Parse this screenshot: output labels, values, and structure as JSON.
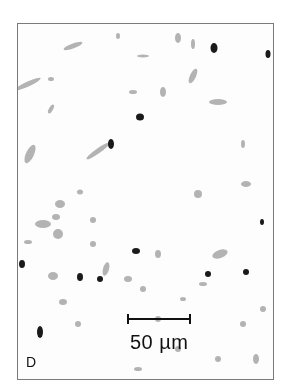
{
  "figure": {
    "panel_label": "D",
    "scale_bar": {
      "label": "50 µm",
      "length_px": 64
    }
  },
  "colors": {
    "background": "#ffffff",
    "border": "#7a7a7a",
    "stain_dark": "#1a1a1a",
    "stain_light": "#9a9a9a"
  }
}
